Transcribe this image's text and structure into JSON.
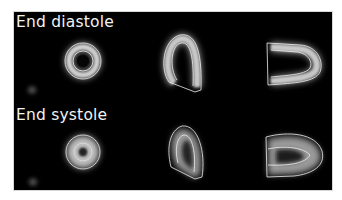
{
  "figure": {
    "background": "#000000",
    "rows": [
      {
        "label": "End diastole",
        "views": [
          "short-axis",
          "vertical-long-axis",
          "horizontal-long-axis"
        ]
      },
      {
        "label": "End systole",
        "views": [
          "short-axis",
          "vertical-long-axis",
          "horizontal-long-axis"
        ]
      }
    ],
    "contour_color": "#e6e6e6"
  }
}
